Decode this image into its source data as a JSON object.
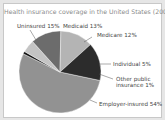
{
  "chart_data": {
    "type": "pie",
    "title": "Health insurance coverage in the United States (2007)",
    "categories": [
      "Employer-insured",
      "Other public insurance",
      "Individual",
      "Medicare",
      "Medicaid",
      "Uninsured"
    ],
    "values": [
      54,
      1,
      5,
      12,
      13,
      15
    ],
    "unit": "%",
    "labels": [
      "Employer-insured 54%",
      "Other public insurance 1%",
      "Individual 5%",
      "Medicare 12%",
      "Medicaid 13%",
      "Uninsured 15%"
    ],
    "colors": [
      "#929292",
      "#111111",
      "#c4c4c4",
      "#6c6c6c",
      "#b4b4b4",
      "#2c2c2c"
    ],
    "legend": "none (callout labels)"
  },
  "labels": {
    "uninsured": "Uninsured 15%",
    "medicaid": "Medicaid 13%",
    "medicare": "Medicare 12%",
    "individual": "Individual 5%",
    "other_line1": "Other public",
    "other_line2": "insurance 1%",
    "employer": "Employer-insured 54%"
  }
}
